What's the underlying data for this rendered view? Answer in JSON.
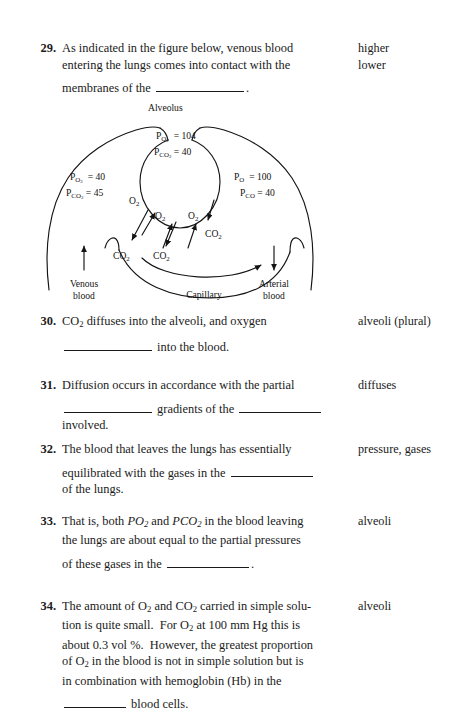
{
  "page": {
    "background": "#ffffff",
    "ink": "#1a1a1a"
  },
  "questions": [
    {
      "number": "29.",
      "lines": [
        "As indicated in the figure below, venous blood",
        "entering the lungs comes into contact with the",
        "membranes of the ____________."
      ],
      "answers": [
        "higher",
        "lower"
      ]
    },
    {
      "number": "30.",
      "lines": [
        "CO2 diffuses into the alveoli, and oxygen",
        "____________ into the blood."
      ],
      "answers": [
        "alveoli (plural)"
      ]
    },
    {
      "number": "31.",
      "lines": [
        "Diffusion occurs in accordance with the partial",
        "____________ gradients of the ____________",
        "involved."
      ],
      "answers": [
        "diffuses"
      ]
    },
    {
      "number": "32.",
      "lines": [
        "The blood that leaves the lungs has essentially",
        "equilibrated with the gases in the ____________",
        "of the lungs."
      ],
      "answers": [
        "pressure, gases"
      ]
    },
    {
      "number": "33.",
      "lines": [
        "That is, both PO2 and PCO2 in the blood leaving",
        "the lungs are about equal to the partial pressures",
        "of these gases in the ____________."
      ],
      "answers": [
        "alveoli"
      ]
    },
    {
      "number": "34.",
      "lines": [
        "The amount of O2 and CO2 carried in simple solu-",
        "tion is quite small.  For O2 at 100 mm Hg this is",
        "about 0.3 vol %.  However, the greatest proportion",
        "of O2 in the blood is not in simple solution but is",
        "in combination with hemoglobin (Hb) in the",
        "__________ blood cells."
      ],
      "answers": [
        "alveoli"
      ]
    }
  ],
  "figure": {
    "title": "Alveolus",
    "alveolus": {
      "po2_label": "P",
      "po2_sub": "O2",
      "po2_value": "= 104",
      "pco2_label": "P",
      "pco2_sub": "CO2",
      "pco2_value": "= 40"
    },
    "left_side": {
      "po2_label": "P",
      "po2_sub": "O2",
      "po2_value": "= 40",
      "pco2_label": "P",
      "pco2_sub": "CO2",
      "pco2_value": "= 45"
    },
    "right_side": {
      "po_label": "P",
      "po_sub": "O",
      "po_value": "= 100",
      "pco_label": "P",
      "pco_sub": "CO",
      "pco_value": "= 40"
    },
    "gas_labels": {
      "o2_a": "O",
      "o2_b": "O",
      "o2_c": "O",
      "o2_sub": "2",
      "co2_a": "CO",
      "co2_b": "CO",
      "co2_c": "CO",
      "co2_sub": "2"
    },
    "flow": {
      "venous_line1": "Venous",
      "venous_line2": "blood",
      "capillary": "Capillary",
      "arterial_line1": "Arterial",
      "arterial_line2": "blood"
    }
  }
}
